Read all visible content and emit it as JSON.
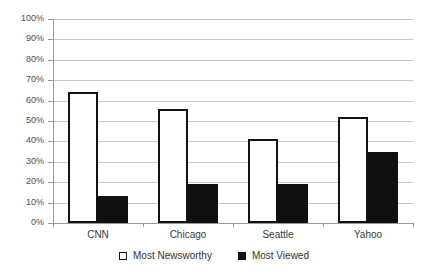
{
  "chart_data": {
    "type": "bar",
    "title": "",
    "subtitle": "",
    "xlabel": "",
    "ylabel": "",
    "categories": [
      "CNN",
      "Chicago",
      "Seattle",
      "Yahoo"
    ],
    "series": [
      {
        "name": "Most Newsworthy",
        "values": [
          64,
          56,
          41,
          52
        ],
        "color": "#ffffff",
        "edge_color": "#111111"
      },
      {
        "name": "Most Viewed",
        "values": [
          13,
          19,
          19,
          35
        ],
        "color": "#101010",
        "edge_color": "#101010"
      }
    ],
    "ylim": [
      0,
      100
    ],
    "y_ticks": [
      0,
      10,
      20,
      30,
      40,
      50,
      60,
      70,
      80,
      90,
      100
    ],
    "y_tick_labels": [
      "0%",
      "10%",
      "20%",
      "30%",
      "40%",
      "50%",
      "60%",
      "70%",
      "80%",
      "90%",
      "100%"
    ],
    "grid": true,
    "grid_axis": "y",
    "grid_color": "#c9c9c9",
    "legend_position": "bottom-center",
    "value_suffix": "%"
  },
  "axis": {
    "y_labels": [
      "100%",
      "90%",
      "80%",
      "70%",
      "60%",
      "50%",
      "40%",
      "30%",
      "20%",
      "10%",
      "0%"
    ],
    "x_labels": [
      "CNN",
      "Chicago",
      "Seattle",
      "Yahoo"
    ]
  },
  "legend": {
    "items": [
      {
        "label": "Most Newsworthy",
        "marker": "open-square-marker"
      },
      {
        "label": "Most Viewed",
        "marker": "filled-square-marker"
      }
    ]
  }
}
